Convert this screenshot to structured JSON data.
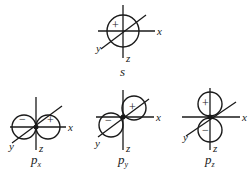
{
  "diagram": {
    "orbitals": [
      {
        "id": "s",
        "name": "s",
        "subscript": "",
        "lobes": [
          {
            "sign": "+"
          }
        ]
      },
      {
        "id": "px",
        "name": "p",
        "subscript": "x",
        "lobes": [
          {
            "sign": "−"
          },
          {
            "sign": "+"
          }
        ]
      },
      {
        "id": "py",
        "name": "p",
        "subscript": "y",
        "lobes": [
          {
            "sign": "−"
          },
          {
            "sign": "+"
          }
        ]
      },
      {
        "id": "pz",
        "name": "p",
        "subscript": "z",
        "lobes": [
          {
            "sign": "+"
          },
          {
            "sign": "−"
          }
        ]
      }
    ],
    "axis_labels": {
      "x": "x",
      "y": "y",
      "z": "z"
    }
  }
}
